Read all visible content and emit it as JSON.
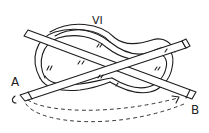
{
  "figure": {
    "title": "VI",
    "labels": {
      "start": "A",
      "end": "B"
    },
    "colors": {
      "ink": "#1c1c1c",
      "background": "#ffffff"
    }
  }
}
